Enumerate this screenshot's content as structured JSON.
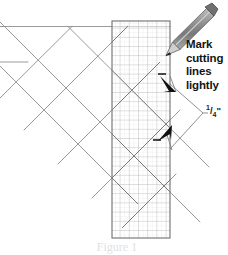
{
  "figure": {
    "callout": {
      "lines": [
        "Mark",
        "cutting",
        "lines",
        "lightly"
      ],
      "line1": "Mark",
      "line2": "cutting",
      "line3": "lines",
      "line4": "lightly"
    },
    "measurement": {
      "numerator": "1",
      "slash": "/",
      "denominator": "4",
      "unit": "\"",
      "full": "1/4\""
    },
    "caption": "Figure 1",
    "colors": {
      "background": "#ffffff",
      "fabric_line": "#8c8c8c",
      "ruler_border": "#6e6e6e",
      "grid_major": "#b4b4b4",
      "grid_minor": "#dcdcdc",
      "pencil_body": "#9a9a9a",
      "pencil_dark": "#5a5a5a",
      "arrow": "#111111",
      "text": "#141414",
      "leader": "#7a7a7a"
    },
    "elements": {
      "ruler_name": "transparent gridded quilting ruler",
      "pencil_name": "marking pencil",
      "arrow1_name": "upper cutting line indicator",
      "arrow2_name": "lower cutting line indicator",
      "fabric_name": "pieced fabric diamond lattice"
    }
  }
}
